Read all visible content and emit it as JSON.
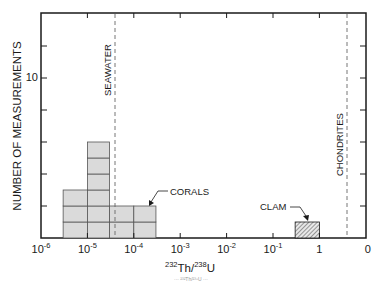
{
  "chart_data": {
    "type": "bar",
    "subtype": "histogram",
    "title": "",
    "xlabel": "232Th/238U",
    "xlabel_parts": {
      "sup1": "232",
      "base1": "Th/",
      "sup2": "238",
      "base2": "U"
    },
    "ylabel": "NUMBER OF MEASUREMENTS",
    "xscale": "log",
    "x_ticks": [
      {
        "base": "10",
        "exp": "-6"
      },
      {
        "base": "10",
        "exp": "-5"
      },
      {
        "base": "10",
        "exp": "-4"
      },
      {
        "base": "10",
        "exp": "-3"
      },
      {
        "base": "10",
        "exp": "-2"
      },
      {
        "base": "10",
        "exp": "-1"
      },
      {
        "base": "1",
        "exp": ""
      },
      {
        "base": "0",
        "exp": ""
      }
    ],
    "xlim": [
      "1e-6",
      "10"
    ],
    "y_ticks_labeled": [
      {
        "value": 10,
        "label": "10"
      }
    ],
    "y_tick_values": [
      2,
      4,
      6,
      8,
      10,
      12
    ],
    "ylim": [
      0,
      14
    ],
    "grid": false,
    "legend": null,
    "series": [
      {
        "name": "CORALS",
        "style": "gray-stacked-cells",
        "color": "#dadada",
        "bins": [
          {
            "x_from": "3e-6",
            "x_to": "1e-5",
            "count": 3
          },
          {
            "x_from": "1e-5",
            "x_to": "3e-5",
            "count": 6
          },
          {
            "x_from": "3e-5",
            "x_to": "1e-4",
            "count": 2
          },
          {
            "x_from": "1e-4",
            "x_to": "3e-4",
            "count": 2
          }
        ]
      },
      {
        "name": "CLAM",
        "style": "hatched",
        "bins": [
          {
            "x_from": "3e-1",
            "x_to": "1",
            "count": 1
          }
        ]
      }
    ],
    "reference_lines": [
      {
        "label": "SEAWATER",
        "x": "4e-5",
        "style": "dashed"
      },
      {
        "label": "CHONDRITES",
        "x": "4",
        "style": "dashed"
      }
    ],
    "annotations": [
      {
        "text": "CORALS",
        "points_to": "CORALS bars"
      },
      {
        "text": "CLAM",
        "points_to": "CLAM bar"
      }
    ]
  },
  "labels": {
    "seawater": "SEAWATER",
    "chondrites": "CHONDRITES",
    "corals": "CORALS",
    "clam": "CLAM",
    "y_title": "NUMBER OF MEASUREMENTS",
    "y_tick_10": "10",
    "caption_fragment": "··· ²³²Th/²³⁸U ···"
  },
  "colors": {
    "axis": "#1a1a1a",
    "fill": "#dadada",
    "cell_line": "#555555",
    "dashed": "#666666"
  }
}
